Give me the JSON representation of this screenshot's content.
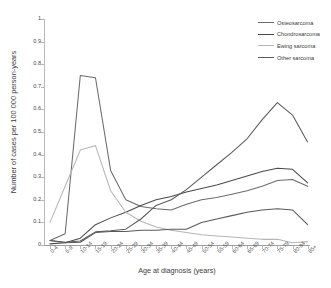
{
  "chart_data": {
    "type": "line",
    "title": "",
    "xlabel": "Age at diagnosis (years)",
    "ylabel": "Number of cases per 100 000 person-years",
    "ylim": [
      0,
      1
    ],
    "yticks": [
      "0",
      "0.1",
      "0.2",
      "0.3",
      "0.4",
      "0.5",
      "0.6",
      "0.7",
      "0.8",
      "0.9",
      "1"
    ],
    "grid": false,
    "legend_position": "top-right",
    "categories": [
      "0-4",
      "5-9",
      "10-14",
      "15-19",
      "20-24",
      "25-29",
      "30-34",
      "35-39",
      "40-44",
      "45-49",
      "50-54",
      "55-59",
      "60-64",
      "65-69",
      "70-74",
      "75-79",
      "80-84",
      "85+"
    ],
    "series": [
      {
        "name": "Osteosarcoma",
        "color": "#6b6b6b",
        "values": [
          0.02,
          0.05,
          0.75,
          0.74,
          0.33,
          0.2,
          0.17,
          0.16,
          0.155,
          0.18,
          0.2,
          0.21,
          0.225,
          0.24,
          0.26,
          0.285,
          0.29,
          0.26
        ]
      },
      {
        "name": "Chondrosarcoma",
        "color": "#4a4a4a",
        "values": [
          0.005,
          0.01,
          0.03,
          0.09,
          0.12,
          0.145,
          0.175,
          0.2,
          0.215,
          0.235,
          0.25,
          0.265,
          0.285,
          0.305,
          0.325,
          0.34,
          0.335,
          0.275
        ]
      },
      {
        "name": "Ewing sarcoma",
        "color": "#b5b5b5",
        "values": [
          0.1,
          0.26,
          0.42,
          0.44,
          0.24,
          0.145,
          0.105,
          0.08,
          0.065,
          0.055,
          0.045,
          0.04,
          0.035,
          0.03,
          0.025,
          0.025,
          0.01,
          0.015
        ]
      },
      {
        "name": "Other sarcoma",
        "color": "#5a5a5a",
        "values": [
          0.02,
          0.01,
          0.012,
          0.055,
          0.06,
          0.06,
          0.065,
          0.065,
          0.07,
          0.07,
          0.1,
          0.115,
          0.13,
          0.145,
          0.155,
          0.16,
          0.155,
          0.09
        ]
      }
    ],
    "series_rising": {
      "name": "Other sarcoma rising arm",
      "values": [
        0.02,
        0.01,
        0.012,
        0.055,
        0.06,
        0.06,
        0.065,
        0.065,
        0.07,
        0.07,
        0.1,
        0.115,
        0.13,
        0.145,
        0.155,
        0.16,
        0.155,
        0.09
      ]
    }
  },
  "legend": {
    "items": [
      {
        "label": "Osteosarcoma",
        "color": "#6b6b6b"
      },
      {
        "label": "Chondrosarcoma",
        "color": "#4a4a4a"
      },
      {
        "label": "Ewing sarcoma",
        "color": "#b5b5b5"
      },
      {
        "label": "Other sarcoma",
        "color": "#5a5a5a"
      }
    ]
  },
  "caption": ""
}
